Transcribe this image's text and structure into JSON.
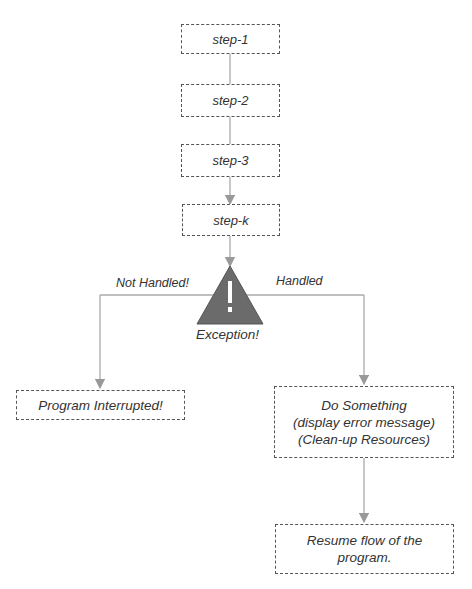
{
  "diagram": {
    "steps": [
      {
        "id": "step-1",
        "label": "step-1"
      },
      {
        "id": "step-2",
        "label": "step-2"
      },
      {
        "id": "step-3",
        "label": "step-3"
      },
      {
        "id": "step-k",
        "label": "step-k"
      }
    ],
    "exception": {
      "label": "Exception!",
      "icon_glyph": "!",
      "color": "#6b6b6b"
    },
    "branches": {
      "not_handled_label": "Not Handled!",
      "handled_label": "Handled"
    },
    "program_interrupted": "Program Interrupted!",
    "do_something": {
      "line1": "Do Something",
      "line2": "(display error message)",
      "line3": "(Clean-up Resources)"
    },
    "resume": {
      "line1": "Resume flow of the",
      "line2": "program."
    },
    "colors": {
      "connector": "#a8a8a8",
      "box_border": "#555555",
      "text": "#333333"
    }
  }
}
